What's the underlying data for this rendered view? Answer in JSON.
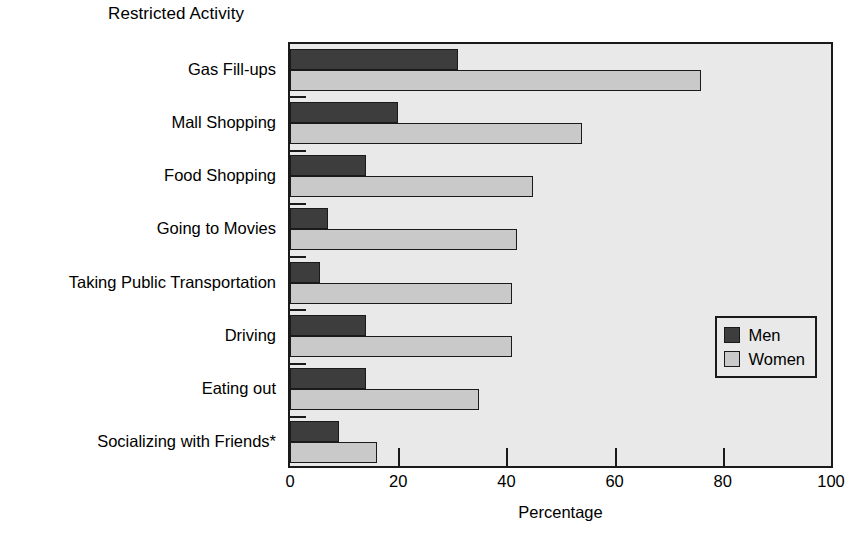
{
  "chart_data": {
    "type": "bar",
    "orientation": "horizontal",
    "title": "Restricted Activity",
    "xlabel": "Percentage",
    "ylabel": "",
    "xlim": [
      0,
      100
    ],
    "xticks": [
      0,
      20,
      40,
      60,
      80,
      100
    ],
    "xtick_labels": [
      "0",
      "20",
      "40",
      "60",
      "80",
      "100"
    ],
    "grid": false,
    "legend_position": "lower right",
    "categories": [
      "Gas Fill-ups",
      "Mall Shopping",
      "Food Shopping",
      "Going to Movies",
      "Taking Public Transportation",
      "Driving",
      "Eating out",
      "Socializing with Friends*"
    ],
    "series": [
      {
        "name": "Men",
        "color": "#3d3d3d",
        "values": [
          31,
          20,
          14,
          7,
          5.5,
          14,
          14,
          9
        ]
      },
      {
        "name": "Women",
        "color": "#c9c9c9",
        "values": [
          76,
          54,
          45,
          42,
          41,
          41,
          35,
          16
        ]
      }
    ]
  },
  "legend": {
    "entries": [
      {
        "label": "Men",
        "color": "#3d3d3d"
      },
      {
        "label": "Women",
        "color": "#c9c9c9"
      }
    ]
  },
  "style": {
    "plot_background": "#e9e9e9",
    "axis_color": "#1a1a1a",
    "page_background": "#ffffff"
  }
}
